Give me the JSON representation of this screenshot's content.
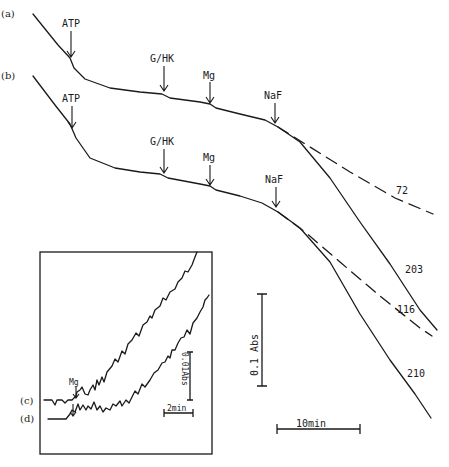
{
  "chart_data": {
    "type": "line",
    "title": "",
    "xlabel": "time",
    "ylabel": "absorbance",
    "grid": false,
    "main_panel": {
      "traces": [
        {
          "id": "a",
          "label": "(a)",
          "style": "solid",
          "points": [
            [
              33,
              14
            ],
            [
              58,
              45
            ],
            [
              70,
              58
            ],
            [
              74,
              68
            ],
            [
              85,
              79
            ],
            [
              110,
              88
            ],
            [
              140,
              92
            ],
            [
              162,
              94
            ],
            [
              170,
              98
            ],
            [
              200,
              102
            ],
            [
              210,
              104
            ],
            [
              216,
              108
            ],
            [
              240,
              114
            ],
            [
              265,
              120
            ],
            [
              278,
              127
            ],
            [
              300,
              142
            ],
            [
              330,
              178
            ],
            [
              360,
              222
            ],
            [
              390,
              264
            ],
            [
              420,
              310
            ],
            [
              437,
              330
            ]
          ],
          "end_label": "203"
        },
        {
          "id": "a-extrap",
          "style": "dashed",
          "points": [
            [
              278,
              127
            ],
            [
              310,
              147
            ],
            [
              350,
              172
            ],
            [
              395,
              198
            ],
            [
              433,
              214
            ]
          ],
          "end_label": "72"
        },
        {
          "id": "b",
          "label": "(b)",
          "style": "solid",
          "points": [
            [
              33,
              76
            ],
            [
              55,
              105
            ],
            [
              70,
              124
            ],
            [
              76,
              138
            ],
            [
              90,
              158
            ],
            [
              115,
              168
            ],
            [
              140,
              172
            ],
            [
              160,
              174
            ],
            [
              168,
              178
            ],
            [
              200,
              184
            ],
            [
              210,
              186
            ],
            [
              216,
              190
            ],
            [
              240,
              196
            ],
            [
              262,
              203
            ],
            [
              278,
              212
            ],
            [
              300,
              228
            ],
            [
              330,
              262
            ],
            [
              360,
              314
            ],
            [
              390,
              360
            ],
            [
              415,
              394
            ],
            [
              431,
              418
            ]
          ],
          "end_label": "210"
        },
        {
          "id": "b-extrap",
          "style": "dashed",
          "points": [
            [
              278,
              212
            ],
            [
              305,
              232
            ],
            [
              340,
              262
            ],
            [
              380,
              296
            ],
            [
              420,
              328
            ],
            [
              432,
              336
            ]
          ],
          "end_label": "116"
        }
      ],
      "annotations": [
        {
          "trace": "a",
          "text": "ATP",
          "x": 71,
          "y": 58
        },
        {
          "trace": "a",
          "text": "G/HK",
          "x": 164,
          "y": 92
        },
        {
          "trace": "a",
          "text": "Mg",
          "x": 210,
          "y": 104
        },
        {
          "trace": "a",
          "text": "NaF",
          "x": 275,
          "y": 124
        },
        {
          "trace": "b",
          "text": "ATP",
          "x": 72,
          "y": 124
        },
        {
          "trace": "b",
          "text": "G/HK",
          "x": 164,
          "y": 174
        },
        {
          "trace": "b",
          "text": "Mg",
          "x": 210,
          "y": 186
        },
        {
          "trace": "b",
          "text": "NaF",
          "x": 276,
          "y": 208
        }
      ],
      "end_labels": [
        "72",
        "203",
        "116",
        "210"
      ]
    },
    "inset_panel": {
      "traces": [
        {
          "id": "c",
          "label": "(c)",
          "annotation": "Mg"
        },
        {
          "id": "d",
          "label": "(d)"
        }
      ],
      "scale_bars": {
        "vertical": "0.01Abs",
        "horizontal": "2min"
      }
    },
    "scale_bars": {
      "vertical": "0.1 Abs",
      "horizontal": "10min"
    }
  },
  "labels": {
    "trace_a": "(a)",
    "trace_b": "(b)",
    "trace_c": "(c)",
    "trace_d": "(d)",
    "atp": "ATP",
    "ghk": "G/HK",
    "mg": "Mg",
    "naf": "NaF",
    "end_72": "72",
    "end_203": "203",
    "end_116": "116",
    "end_210": "210",
    "vbar": "0.1 Abs",
    "hbar": "10min",
    "inset_vbar": "0.01Abs",
    "inset_hbar": "2min",
    "inset_mg": "Mg"
  }
}
